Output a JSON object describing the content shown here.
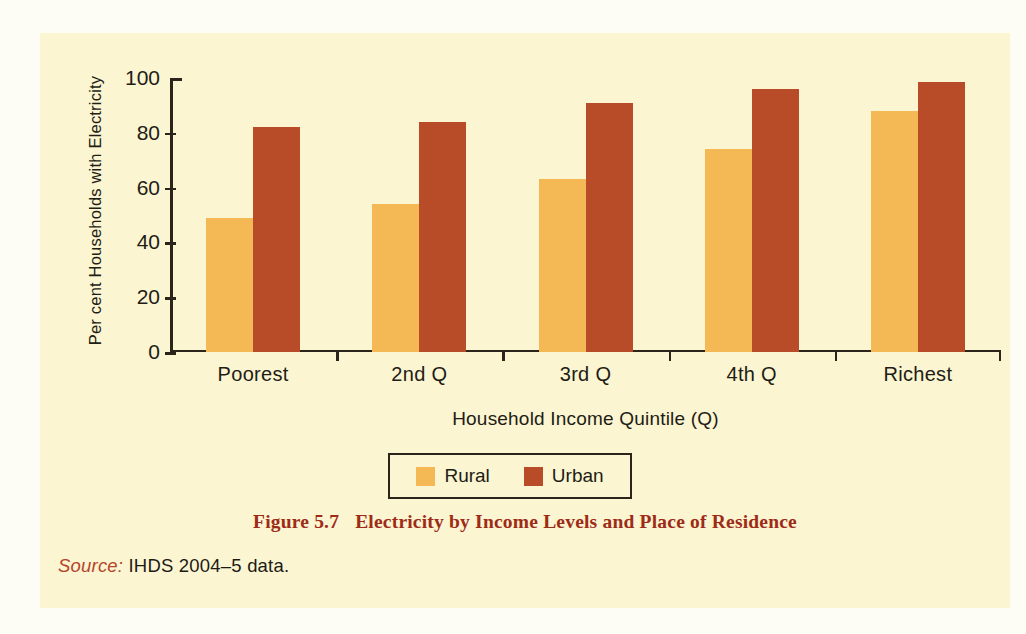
{
  "panel": {
    "background": "#fbf5d2",
    "page_background": "#fdfdf5"
  },
  "caption": {
    "number": "Figure 5.7",
    "text": "Electricity by Income Levels and Place of Residence",
    "color": "#9e2b16"
  },
  "source": {
    "label": "Source:",
    "text": "IHDS 2004–5 data.",
    "label_color": "#b5452a"
  },
  "legend": {
    "position": "below-axis",
    "entries": [
      {
        "label": "Rural",
        "color": "#f4b955"
      },
      {
        "label": "Urban",
        "color": "#b94c28"
      }
    ]
  },
  "chart_data": {
    "type": "bar",
    "title": "Electricity by Income Levels and Place of Residence",
    "subtitle": "",
    "xlabel": "Household Income Quintile (Q)",
    "ylabel": "Per cent Households with Electricity",
    "categories": [
      "Poorest",
      "2nd Q",
      "3rd Q",
      "4th Q",
      "Richest"
    ],
    "series": [
      {
        "name": "Rural",
        "color": "#f4b955",
        "values": [
          49,
          54,
          63,
          74,
          88
        ]
      },
      {
        "name": "Urban",
        "color": "#b94c28",
        "values": [
          82,
          84,
          91,
          96,
          98.5
        ]
      }
    ],
    "ylim": [
      0,
      100
    ],
    "yticks": [
      0,
      20,
      40,
      60,
      80,
      100
    ],
    "ytick_labels": [
      "0",
      "20",
      "40",
      "60",
      "80",
      "100"
    ],
    "grid": false,
    "legend_position": "bottom-center",
    "bar_mode": "grouped-adjacent",
    "annotations": []
  }
}
